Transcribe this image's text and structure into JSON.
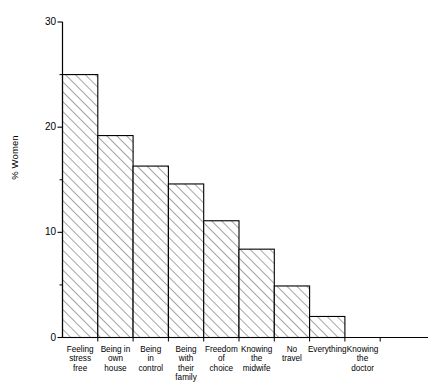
{
  "chart_data": {
    "type": "bar",
    "title": "",
    "subtitle": "",
    "xlabel": "",
    "ylabel": "% Women",
    "ylim": [
      0,
      30
    ],
    "xlim": [
      0,
      9.6
    ],
    "grid": false,
    "legend": false,
    "legend_position": "none",
    "y_major_ticks": [
      0,
      10,
      20,
      30
    ],
    "y_minor_ticks": [
      5,
      15,
      25
    ],
    "y_tick_labels": [
      "0",
      "10",
      "20",
      "30"
    ],
    "bar_style": {
      "fill": "hatch-diagonal",
      "edge_color": "#000000",
      "face_color": "#ffffff",
      "hatch_color": "#555555",
      "bar_gap": 0
    },
    "categories": [
      "Feeling\nstress\nfree",
      "Being in\nown\nhouse",
      "Being\nin\ncontrol",
      "Being\nwith\ntheir\nfamily",
      "Freedom\nof\nchoice",
      "Knowing\nthe\nmidwife",
      "No\ntravel",
      "Everything",
      "Knowing\nthe\ndoctor"
    ],
    "values": [
      25.0,
      19.2,
      16.3,
      14.6,
      11.1,
      8.4,
      4.9,
      2.0,
      0.0
    ]
  }
}
